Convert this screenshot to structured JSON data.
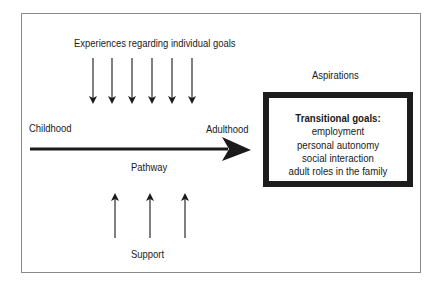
{
  "diagram": {
    "top_label": "Experiences regarding individual goals",
    "start_label": "Childhood",
    "end_label": "Adulthood",
    "pathway_label": "Pathway",
    "bottom_label": "Support",
    "aspirations_label": "Aspirations",
    "goals_box": {
      "title": "Transitional goals:",
      "items": [
        "employment",
        "personal autonomy",
        "social interaction",
        "adult roles in the family"
      ]
    },
    "down_arrow_count": 6,
    "up_arrow_count": 3,
    "colors": {
      "ink": "#1a1a1a",
      "frame": "#8a8a8a",
      "background": "#ffffff"
    }
  }
}
